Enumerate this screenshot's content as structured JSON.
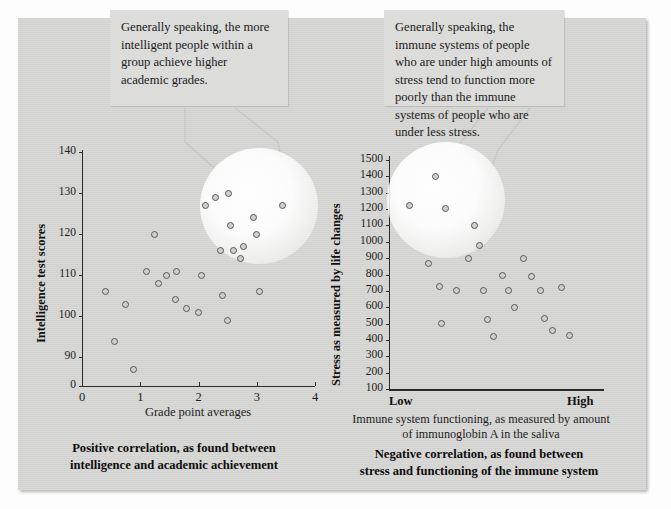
{
  "figure": {
    "background_color": "#d5d5d3",
    "callout_color": "#dcdcda",
    "marker_color": "#cfcfcd",
    "marker_edge_color": "#585858"
  },
  "callouts": {
    "left": "Generally speaking, the more intelligent people within a group achieve higher academic grades.",
    "right": "Generally speaking, the immune systems of people who are under high amounts of stress tend to function more poorly than the immune systems of people who are under less stress."
  },
  "captions": {
    "left": "Positive correlation, as found between intelligence and academic achievement",
    "right": "Negative correlation, as found between stress and functioning of the immune system",
    "right_subcaption": "Immune system functioning, as measured by amount of immunoglobin A in the saliva"
  },
  "chart_data": [
    {
      "type": "scatter",
      "id": "left-scatter",
      "title": "Positive correlation, as found between intelligence and academic achievement",
      "xlabel": "Grade point averages",
      "ylabel": "Intelligence test scores",
      "xlim": [
        0,
        4
      ],
      "ylim": [
        85,
        140
      ],
      "xticks": [
        "0",
        "1",
        "2",
        "3",
        "4"
      ],
      "yticks": [
        "0",
        "90",
        "100",
        "110",
        "120",
        "130",
        "140"
      ],
      "ytick_values": [
        85,
        90,
        100,
        110,
        120,
        130,
        140
      ],
      "axis_break": true,
      "grid": false,
      "legend": "none",
      "points": [
        {
          "x": 0.4,
          "y": 106
        },
        {
          "x": 0.55,
          "y": 94
        },
        {
          "x": 0.75,
          "y": 103
        },
        {
          "x": 0.88,
          "y": 87
        },
        {
          "x": 1.1,
          "y": 111
        },
        {
          "x": 1.25,
          "y": 120
        },
        {
          "x": 1.32,
          "y": 108
        },
        {
          "x": 1.45,
          "y": 110
        },
        {
          "x": 1.6,
          "y": 104
        },
        {
          "x": 1.62,
          "y": 111
        },
        {
          "x": 1.8,
          "y": 102
        },
        {
          "x": 2.05,
          "y": 110
        },
        {
          "x": 2.0,
          "y": 101
        },
        {
          "x": 2.12,
          "y": 127
        },
        {
          "x": 2.3,
          "y": 129
        },
        {
          "x": 2.38,
          "y": 116
        },
        {
          "x": 2.42,
          "y": 105
        },
        {
          "x": 2.5,
          "y": 99
        },
        {
          "x": 2.52,
          "y": 130
        },
        {
          "x": 2.55,
          "y": 122
        },
        {
          "x": 2.6,
          "y": 116
        },
        {
          "x": 2.72,
          "y": 114
        },
        {
          "x": 2.78,
          "y": 117
        },
        {
          "x": 2.95,
          "y": 124
        },
        {
          "x": 3.0,
          "y": 120
        },
        {
          "x": 3.05,
          "y": 106
        },
        {
          "x": 3.45,
          "y": 127
        }
      ],
      "highlight_region": {
        "cx": 2.55,
        "cy": 120,
        "r_x": 0.78,
        "r_y": 14
      }
    },
    {
      "type": "scatter",
      "id": "right-scatter",
      "title": "Negative correlation, as found between stress and functioning of the immune system",
      "xlabel": "Immune system functioning, as measured by amount of immunoglobin A in the saliva",
      "ylabel": "Stress as measured by life changes",
      "xlim": [
        0,
        100
      ],
      "ylim": [
        100,
        1500
      ],
      "xticks": [
        "Low",
        "High"
      ],
      "yticks": [
        "100",
        "200",
        "300",
        "400",
        "500",
        "600",
        "700",
        "800",
        "900",
        "1000",
        "1100",
        "1200",
        "1300",
        "1400",
        "1500"
      ],
      "grid": false,
      "legend": "none",
      "points": [
        {
          "x": 8,
          "y": 1220
        },
        {
          "x": 20,
          "y": 1400
        },
        {
          "x": 25,
          "y": 1205
        },
        {
          "x": 17,
          "y": 870
        },
        {
          "x": 22,
          "y": 725
        },
        {
          "x": 23,
          "y": 500
        },
        {
          "x": 30,
          "y": 700
        },
        {
          "x": 36,
          "y": 900
        },
        {
          "x": 39,
          "y": 1100
        },
        {
          "x": 41,
          "y": 980
        },
        {
          "x": 43,
          "y": 700
        },
        {
          "x": 45,
          "y": 525
        },
        {
          "x": 48,
          "y": 420
        },
        {
          "x": 52,
          "y": 795
        },
        {
          "x": 55,
          "y": 700
        },
        {
          "x": 58,
          "y": 600
        },
        {
          "x": 62,
          "y": 900
        },
        {
          "x": 66,
          "y": 790
        },
        {
          "x": 70,
          "y": 700
        },
        {
          "x": 72,
          "y": 530
        },
        {
          "x": 76,
          "y": 455
        },
        {
          "x": 80,
          "y": 720
        },
        {
          "x": 84,
          "y": 430
        }
      ],
      "highlight_region": {
        "cx": 18,
        "cy": 1280,
        "r_x": 17,
        "r_y": 230
      }
    }
  ]
}
